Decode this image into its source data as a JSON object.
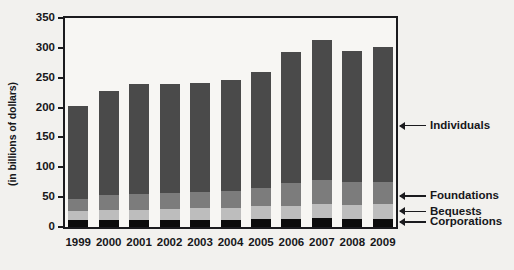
{
  "chart_data": {
    "type": "bar",
    "stacked": true,
    "title": "",
    "xlabel": "",
    "ylabel": "(in billions of dollars)",
    "ylim": [
      0,
      350
    ],
    "yticks": [
      0,
      50,
      100,
      150,
      200,
      250,
      300,
      350
    ],
    "ytick_labels": [
      "0",
      "50",
      "100",
      "150",
      "200",
      "250",
      "300",
      "350"
    ],
    "grid": false,
    "legend_position": "right-callouts",
    "categories": [
      "1999",
      "2000",
      "2001",
      "2002",
      "2003",
      "2004",
      "2005",
      "2006",
      "2007",
      "2008",
      "2009"
    ],
    "series": [
      {
        "name": "Corporations",
        "color": "#0c0c0c",
        "values": [
          11,
          11,
          11,
          11,
          12,
          12,
          14,
          13,
          15,
          14,
          14
        ]
      },
      {
        "name": "Bequests",
        "color": "#bdbdbd",
        "values": [
          16,
          17,
          17,
          19,
          20,
          20,
          21,
          23,
          24,
          23,
          24
        ]
      },
      {
        "name": "Foundations",
        "color": "#7c7c7c",
        "values": [
          20,
          25,
          28,
          27,
          27,
          28,
          30,
          37,
          39,
          39,
          38
        ]
      },
      {
        "name": "Individuals",
        "color": "#4a4a4a",
        "values": [
          155,
          175,
          183,
          183,
          182,
          187,
          194,
          220,
          235,
          218,
          225
        ]
      }
    ],
    "totals": [
      202,
      228,
      239,
      240,
      241,
      247,
      259,
      293,
      313,
      294,
      301
    ],
    "annotations": [
      {
        "label": "Individuals",
        "at_value": 170
      },
      {
        "label": "Foundations",
        "at_value": 52
      },
      {
        "label": "Bequests",
        "at_value": 26
      },
      {
        "label": "Corporations",
        "at_value": 8
      }
    ]
  }
}
